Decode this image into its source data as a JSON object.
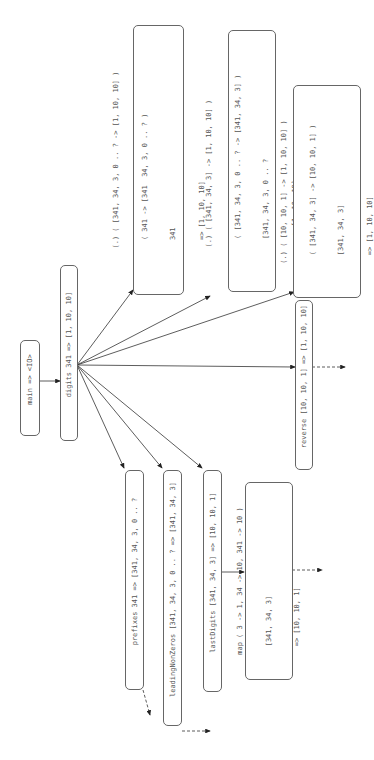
{
  "diagram": {
    "orientation": "rotated-90-ccw",
    "nodes": {
      "main": {
        "lines": [
          "main => <IO>"
        ]
      },
      "digits": {
        "lines": [
          "digits 341 => [1, 10, 10]"
        ]
      },
      "compose1": {
        "lines": [
          "(.) ( [341, 34, 3, 0 .. ? -> [1, 10, 10] )",
          "  ( 341 -> [341  34, 3, 0 .. ? )",
          "  341",
          "  => [1, 10, 10]"
        ]
      },
      "compose2": {
        "lines": [
          "(.) ( [341, 34, 3] -> [1, 10, 10] )",
          "  ( [341, 34, 3, 0 .. ? -> [341, 34, 3] )",
          "  [341, 34, 3, 0 .. ?",
          "  => [1, 10, 10]"
        ]
      },
      "compose3": {
        "lines": [
          "(.) ( [10, 10, 1] -> [1, 10, 10] )",
          "  ( [341, 34, 3] -> [10, 10, 1] )",
          "  [341, 34, 3]",
          "  => [1, 10, 10]"
        ]
      },
      "reverse": {
        "lines": [
          "reverse [10, 10, 1] => [1, 10, 10]"
        ]
      },
      "prefixes": {
        "lines": [
          "prefixes 341 => [341, 34, 3, 0 .. ?"
        ]
      },
      "leadingNonZeros": {
        "lines": [
          "leadingNonZeros [341, 34, 3, 0 .. ? => [341, 34, 3]"
        ]
      },
      "lastDigits": {
        "lines": [
          "lastDigits [341, 34, 3] => [10, 10, 1]"
        ]
      },
      "map": {
        "lines": [
          "map ( 3 -> 1, 34 -> 10, 341 -> 10 )",
          "  [341, 34, 3]",
          "  => [10, 10, 1]"
        ]
      }
    },
    "edges": [
      {
        "from": "main",
        "to": "digits",
        "style": "solid"
      },
      {
        "from": "digits",
        "to": "compose1",
        "style": "solid"
      },
      {
        "from": "digits",
        "to": "compose2",
        "style": "solid"
      },
      {
        "from": "digits",
        "to": "compose3",
        "style": "solid"
      },
      {
        "from": "digits",
        "to": "reverse",
        "style": "solid"
      },
      {
        "from": "digits",
        "to": "prefixes",
        "style": "solid"
      },
      {
        "from": "digits",
        "to": "leadingNonZeros",
        "style": "solid"
      },
      {
        "from": "digits",
        "to": "lastDigits",
        "style": "solid"
      },
      {
        "from": "lastDigits",
        "to": "map",
        "style": "solid"
      },
      {
        "from": "prefixes",
        "to": "leadingNonZeros",
        "style": "dashed"
      },
      {
        "from": "leadingNonZeros",
        "to": "lastDigits",
        "style": "dashed"
      },
      {
        "from": "map",
        "to": "reverse",
        "style": "dashed"
      },
      {
        "from": "reverse",
        "to": "offscreen",
        "style": "dashed"
      }
    ]
  }
}
